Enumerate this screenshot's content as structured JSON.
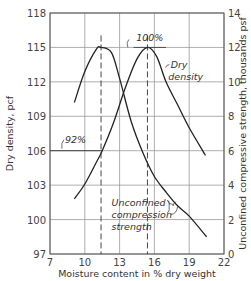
{
  "chart_data": {
    "type": "line",
    "title": "",
    "xlabel": "Moisture content in % dry weight",
    "ylabel": "Dry density, pcf",
    "y2label": "Unconfined compressive strength, thousands psf",
    "xlim": [
      7,
      22
    ],
    "ylim": [
      97,
      118
    ],
    "y2lim": [
      0,
      14
    ],
    "x_ticks": [
      "7",
      "10",
      "13",
      "16",
      "19",
      "22"
    ],
    "y_ticks": [
      "97",
      "100",
      "103",
      "106",
      "109",
      "112",
      "115",
      "118"
    ],
    "y2_ticks": [
      "0",
      "2",
      "4",
      "6",
      "8",
      "10",
      "12",
      "14"
    ],
    "grid": true,
    "series": [
      {
        "name": "Dry density",
        "axis": "left",
        "x": [
          9.1,
          10,
          11,
          11.5,
          12.5,
          13.5,
          14.5,
          15.4,
          16.2,
          17,
          18,
          19,
          20.4
        ],
        "values": [
          101.8,
          103.1,
          105,
          106,
          108.5,
          111.5,
          114,
          115,
          114.2,
          112,
          110,
          108,
          105.6
        ]
      },
      {
        "name": "Unconfined compression strength",
        "axis": "right",
        "x": [
          9.1,
          10,
          11,
          11.4,
          12.3,
          13,
          14,
          15,
          16,
          17,
          18,
          19,
          20.5
        ],
        "values": [
          8.8,
          10.6,
          11.9,
          12,
          11.7,
          10.2,
          7.7,
          5.9,
          4.5,
          3.6,
          2.8,
          2.2,
          1.0
        ]
      }
    ],
    "annotations": [
      {
        "text": "100%",
        "note": "max dry density at optimum moisture ~15.4%"
      },
      {
        "text": "92%",
        "note": "92% of max dry density, ~106 pcf"
      },
      {
        "text": "Dry density"
      },
      {
        "text": "Unconfined compression strength"
      }
    ]
  }
}
